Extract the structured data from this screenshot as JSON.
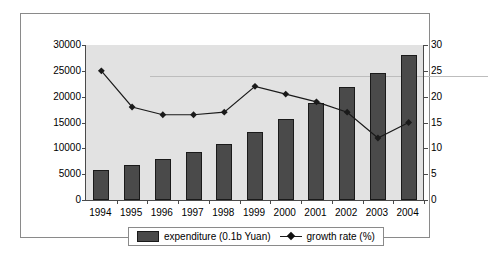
{
  "chart_data": {
    "type": "bar",
    "title": "",
    "subtitle": "",
    "xlabel": "",
    "ylabel": "",
    "categories": [
      "1994",
      "1995",
      "1996",
      "1997",
      "1998",
      "1999",
      "2000",
      "2001",
      "2002",
      "2003",
      "2004"
    ],
    "grid": false,
    "legend_position": "bottom",
    "axes": {
      "left": {
        "label": "",
        "min": 0,
        "max": 30000,
        "step": 5000,
        "ticks": [
          0,
          5000,
          10000,
          15000,
          20000,
          25000,
          30000
        ],
        "tick_labels": [
          "0",
          "5000",
          "10000",
          "15000",
          "20000",
          "25000",
          "30000"
        ]
      },
      "right": {
        "label": "",
        "min": 0,
        "max": 30,
        "step": 5,
        "ticks": [
          0,
          5,
          10,
          15,
          20,
          25,
          30
        ],
        "tick_labels": [
          "0",
          "5",
          "10",
          "15",
          "20",
          "25",
          "30"
        ]
      }
    },
    "series": [
      {
        "name": "expenditure (0.1b Yuan)",
        "type": "bar",
        "axis": "left",
        "color": "#4a4a4a",
        "values": [
          5800,
          6700,
          7900,
          9200,
          10800,
          13100,
          15700,
          18700,
          21800,
          24500,
          28100
        ]
      },
      {
        "name": "growth rate (%)",
        "type": "line",
        "axis": "right",
        "color": "#1a1a1a",
        "marker": "diamond",
        "values": [
          25.0,
          18.0,
          16.5,
          16.5,
          17.0,
          22.0,
          20.5,
          19.0,
          17.0,
          12.0,
          15.0
        ]
      }
    ]
  },
  "legend": {
    "items": [
      {
        "label": "expenditure (0.1b Yuan)",
        "glyph": "bar-swatch"
      },
      {
        "label": "growth rate (%)",
        "glyph": "line-marker"
      }
    ]
  },
  "colors": {
    "plot_background": "#e2e2e2",
    "bar_fill": "#4a4a4a",
    "bar_stroke": "#1a1a1a",
    "line": "#1a1a1a",
    "axis": "#4a4a4a",
    "frame_border": "#8a8a8a",
    "page_background": "#ffffff"
  }
}
